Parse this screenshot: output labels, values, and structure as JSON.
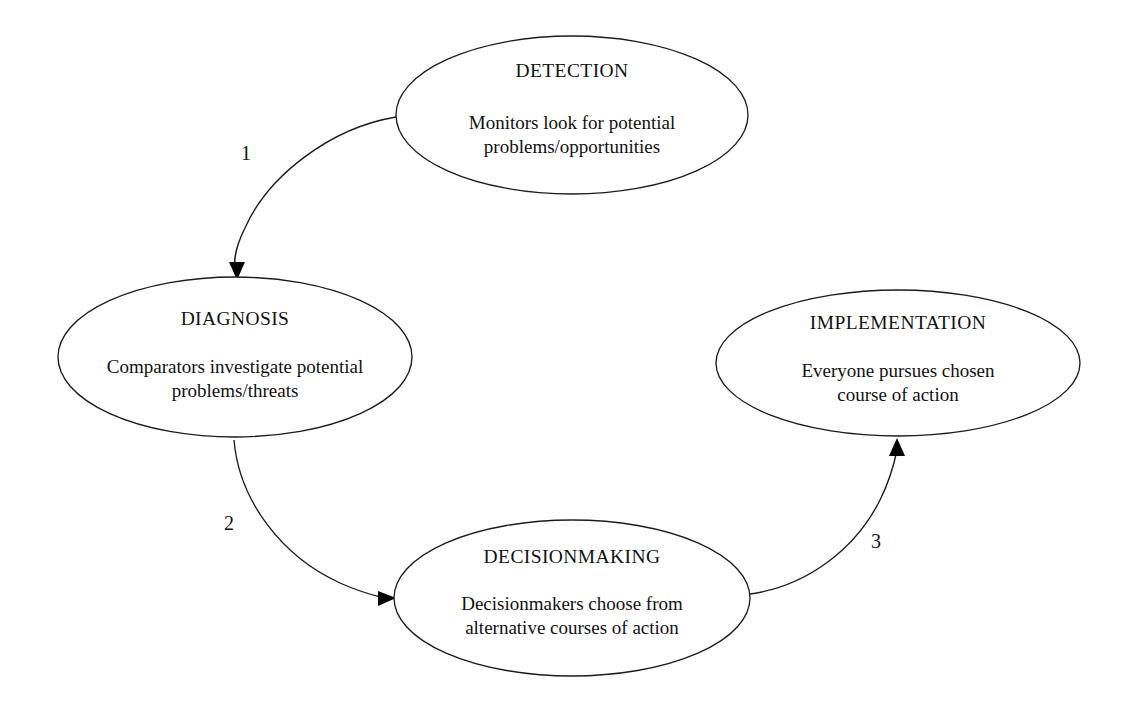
{
  "diagram": {
    "type": "cycle-flow-diagram",
    "background_color": "#ffffff",
    "stroke_color": "#1b1b1b",
    "text_color": "#111111",
    "nodes": [
      {
        "id": "detection",
        "title": "DETECTION",
        "body_line1": "Monitors look for potential",
        "body_line2": "problems/opportunities",
        "shape": "ellipse",
        "cx": 572,
        "cy": 115,
        "rx": 176,
        "ry": 79
      },
      {
        "id": "diagnosis",
        "title": "DIAGNOSIS",
        "body_line1": "Comparators investigate potential",
        "body_line2": "problems/threats",
        "shape": "ellipse",
        "cx": 235,
        "cy": 357,
        "rx": 177,
        "ry": 80
      },
      {
        "id": "decisionmaking",
        "title": "DECISIONMAKING",
        "body_line1": "Decisionmakers choose from",
        "body_line2": "alternative courses of action",
        "shape": "ellipse",
        "cx": 572,
        "cy": 598,
        "rx": 178,
        "ry": 78
      },
      {
        "id": "implementation",
        "title": "IMPLEMENTATION",
        "body_line1": "Everyone pursues chosen",
        "body_line2": "course of action",
        "shape": "ellipse",
        "cx": 898,
        "cy": 363,
        "rx": 182,
        "ry": 73
      }
    ],
    "edges": [
      {
        "id": "edge-1",
        "label": "1",
        "from": "detection",
        "to": "diagnosis",
        "label_x": 246,
        "label_y": 160
      },
      {
        "id": "edge-2",
        "label": "2",
        "from": "diagnosis",
        "to": "decisionmaking",
        "label_x": 229,
        "label_y": 530
      },
      {
        "id": "edge-3",
        "label": "3",
        "from": "decisionmaking",
        "to": "implementation",
        "label_x": 876,
        "label_y": 548
      }
    ]
  }
}
